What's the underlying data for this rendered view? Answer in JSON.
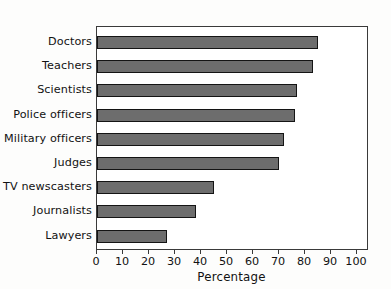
{
  "chart_data": {
    "type": "bar",
    "orientation": "horizontal",
    "title": "",
    "xlabel": "Percentage",
    "ylabel": "",
    "categories": [
      "Doctors",
      "Teachers",
      "Scientists",
      "Police officers",
      "Military officers",
      "Judges",
      "TV newscasters",
      "Journalists",
      "Lawyers"
    ],
    "values": [
      85,
      83,
      77,
      76,
      72,
      70,
      45,
      38,
      27
    ],
    "xlim": [
      0,
      105
    ],
    "xticks": [
      0,
      10,
      20,
      30,
      40,
      50,
      60,
      70,
      80,
      90,
      100
    ],
    "xtick_labels": [
      "0",
      "10",
      "20",
      "30",
      "40",
      "50",
      "60",
      "70",
      "80",
      "90",
      "100"
    ],
    "grid": false,
    "legend": false,
    "bar_fill_color": "#6d6d6d",
    "bar_edge_color": "#141414",
    "frame_color": "#3a3a3a",
    "background_color": "#ffffff"
  }
}
